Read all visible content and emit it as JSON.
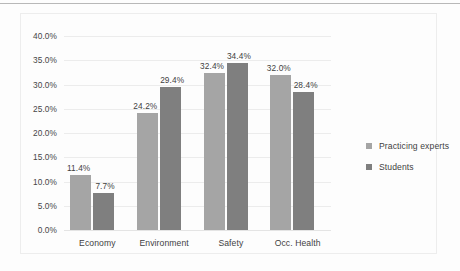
{
  "chart_data": {
    "type": "bar",
    "title": "",
    "subtitle": "",
    "xlabel": "",
    "ylabel": "",
    "categories": [
      "Economy",
      "Environment",
      "Safety",
      "Occ. Health"
    ],
    "series": [
      {
        "name": "Practicing experts",
        "color": "#a5a5a5",
        "values": [
          11.4,
          24.2,
          32.4,
          32.0
        ],
        "labels": [
          "11.4%",
          "24.2%",
          "32.4%",
          "32.0%"
        ]
      },
      {
        "name": "Students",
        "color": "#7f7f7f",
        "values": [
          7.7,
          29.4,
          34.4,
          28.4
        ],
        "labels": [
          "7.7%",
          "29.4%",
          "34.4%",
          "28.4%"
        ]
      }
    ],
    "ylim": [
      0,
      40
    ],
    "ytick_step": 5,
    "ytick_labels": [
      "0.0%",
      "5.0%",
      "10.0%",
      "15.0%",
      "20.0%",
      "25.0%",
      "30.0%",
      "35.0%",
      "40.0%"
    ],
    "ytick_values": [
      0,
      5,
      10,
      15,
      20,
      25,
      30,
      35,
      40
    ],
    "grid": true,
    "legend_position": "right",
    "value_labels_shown": true,
    "axis_unit": "percent"
  },
  "legend": {
    "entries": [
      {
        "label": "Practicing experts",
        "marker": "square-marker"
      },
      {
        "label": "Students",
        "marker": "square-marker"
      }
    ]
  },
  "colors": {
    "series_1": "#a5a5a5",
    "series_2": "#7f7f7f",
    "gridline": "#ececec",
    "text": "#3f3f3f",
    "frame_border": "#ededed",
    "page_background": "#fdfdfd",
    "top_rule": "#b8b8b8"
  }
}
